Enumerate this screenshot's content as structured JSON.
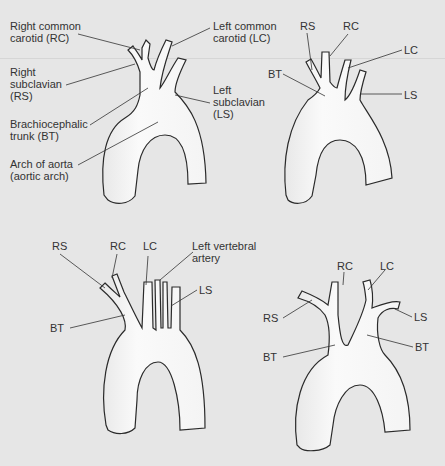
{
  "figure": {
    "panels": [
      {
        "id": "top-left",
        "labels": {
          "rc": "Right common\ncarotid (RC)",
          "lc": "Left common\ncarotid (LC)",
          "rs": "Right\nsubclavian\n(RS)",
          "ls": "Left\nsubclavian\n(LS)",
          "bt": "Brachiocephalic\ntrunk (BT)",
          "arch": "Arch of aorta\n(aortic arch)"
        }
      },
      {
        "id": "top-right",
        "labels": {
          "rs": "RS",
          "rc": "RC",
          "lc": "LC",
          "bt": "BT",
          "ls": "LS"
        }
      },
      {
        "id": "bottom-left",
        "labels": {
          "rs": "RS",
          "rc": "RC",
          "lc": "LC",
          "lva": "Left vertebral\nartery",
          "ls": "LS",
          "bt": "BT"
        }
      },
      {
        "id": "bottom-right",
        "labels": {
          "rc": "RC",
          "lc": "LC",
          "rs": "RS",
          "ls": "LS",
          "bt_right": "BT",
          "bt_left": "BT"
        }
      }
    ]
  },
  "colors": {
    "background": "#e6e6e6",
    "vessel_fill": "#f7f7f7",
    "vessel_shade": "#dcdcdc",
    "outline": "#2a2a2a",
    "text": "#333333"
  }
}
